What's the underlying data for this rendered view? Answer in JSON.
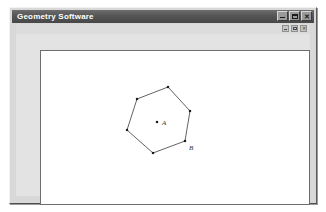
{
  "window": {
    "title": "Geometry Software",
    "controls": [
      {
        "name": "minimize",
        "label": "_"
      },
      {
        "name": "maximize",
        "label": "□"
      },
      {
        "name": "close",
        "label": "✕"
      }
    ]
  },
  "child_window": {
    "title": "",
    "controls": [
      {
        "name": "minimize",
        "label": "_"
      },
      {
        "name": "restore",
        "label": "□"
      },
      {
        "name": "close",
        "label": "✕"
      }
    ]
  },
  "canvas": {
    "background_color": "#ffffff",
    "border_color": "#6e6e6e",
    "stroke_color": "#3a3a3a",
    "point_color": "#1a1a1a",
    "shape": {
      "type": "hexagon",
      "vertex_count": 6,
      "vertices": [
        {
          "x": 127,
          "y": 36
        },
        {
          "x": 96,
          "y": 48
        },
        {
          "x": 86,
          "y": 79
        },
        {
          "x": 112,
          "y": 102
        },
        {
          "x": 144,
          "y": 90
        },
        {
          "x": 149,
          "y": 60
        }
      ],
      "center": {
        "x": 116,
        "y": 71
      }
    },
    "labels": [
      {
        "text": "A",
        "x": 121,
        "y": 74,
        "point": "center"
      },
      {
        "text": "B",
        "x": 148,
        "y": 99,
        "point": "vertex-4"
      }
    ]
  }
}
